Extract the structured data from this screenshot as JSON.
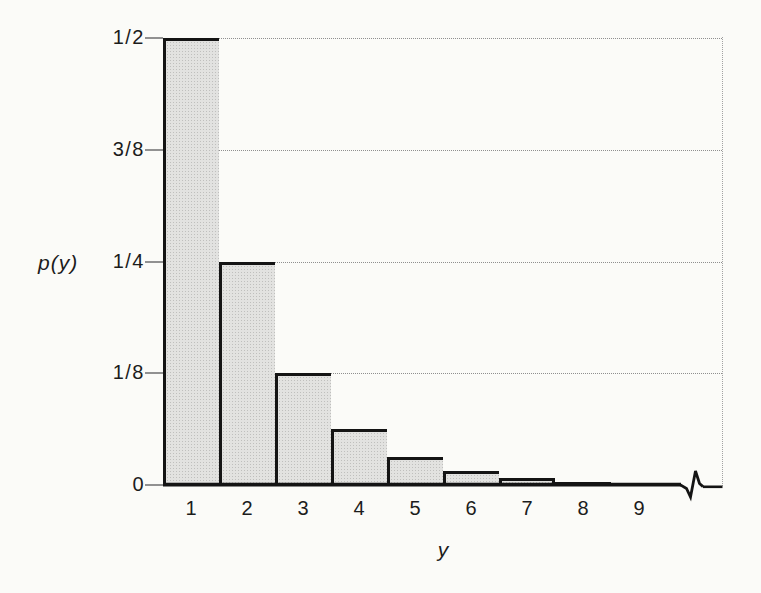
{
  "figure": {
    "background": "#fbfbf8"
  },
  "chart_data": {
    "type": "bar",
    "title": "",
    "xlabel": "y",
    "ylabel": "p(y)",
    "categories": [
      "1",
      "2",
      "3",
      "4",
      "5",
      "6",
      "7",
      "8",
      "9"
    ],
    "values": [
      0.5,
      0.25,
      0.125,
      0.0625,
      0.03125,
      0.015625,
      0.0078125,
      0.00390625,
      0.001953125
    ],
    "value_fractions": [
      "1/2",
      "1/4",
      "1/8",
      "1/16",
      "1/32",
      "1/64",
      "1/128",
      "1/256",
      "1/512"
    ],
    "ylim": [
      0,
      0.5
    ],
    "yticks": [
      {
        "value": 0.5,
        "label": "1/2"
      },
      {
        "value": 0.375,
        "label": "3/8"
      },
      {
        "value": 0.25,
        "label": "1/4"
      },
      {
        "value": 0.125,
        "label": "1/8"
      },
      {
        "value": 0,
        "label": "0"
      }
    ],
    "grid": "dotted horizontal gridlines at each y tick; dotted right frame border",
    "legend": "none",
    "x_axis_break": true,
    "colors": {
      "bar_fill": "#dcdcda",
      "bar_halftone_dot": "#bfbfbd",
      "bar_border": "#141414",
      "gridline": "#8f8f8f",
      "tick": "#919191",
      "ink": "#1c1c1c"
    }
  }
}
